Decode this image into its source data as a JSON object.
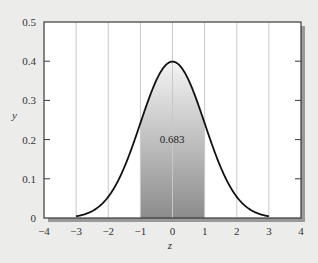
{
  "chart_data": {
    "type": "area",
    "title": "",
    "subtitle": "",
    "xlabel": "z",
    "ylabel": "y",
    "xlim": [
      -4,
      4
    ],
    "ylim": [
      0,
      0.5
    ],
    "x_ticks": [
      -4,
      -3,
      -2,
      -1,
      0,
      1,
      2,
      3,
      4
    ],
    "x_tick_labels": [
      "−4",
      "−3",
      "−2",
      "−1",
      "0",
      "1",
      "2",
      "3",
      "4"
    ],
    "y_ticks": [
      0,
      0.1,
      0.2,
      0.3,
      0.4,
      0.5
    ],
    "y_tick_labels": [
      "0",
      "0.1",
      "0.2",
      "0.3",
      "0.4",
      "0.5"
    ],
    "grid": {
      "vertical": true,
      "horizontal": false
    },
    "legend": null,
    "series": [
      {
        "name": "Standard normal density",
        "function": "y = (1/sqrt(2π)) · exp(−z²/2)",
        "domain": [
          -3,
          3
        ],
        "x": [
          -3,
          -2.5,
          -2,
          -1.5,
          -1,
          -0.5,
          0,
          0.5,
          1,
          1.5,
          2,
          2.5,
          3
        ],
        "values": [
          0.004,
          0.018,
          0.054,
          0.13,
          0.242,
          0.352,
          0.399,
          0.352,
          0.242,
          0.13,
          0.054,
          0.018,
          0.004
        ],
        "color": "#111111"
      }
    ],
    "shaded_region": {
      "from": -1,
      "to": 1,
      "label": "0.683",
      "gradient_top": "#f2f2f2",
      "gradient_bottom": "#8e8e8e"
    },
    "annotations": [
      {
        "text": "0.683",
        "x": 0,
        "y": 0.18
      }
    ]
  },
  "labels": {
    "xlabel": "z",
    "ylabel": "y",
    "area": "0.683"
  },
  "colors": {
    "background": "#ececeb",
    "plot_background": "#ffffff",
    "frame": "#3a3a3a",
    "gridline": "#c8c8c8",
    "curve": "#111111",
    "shadow": "#555555"
  }
}
